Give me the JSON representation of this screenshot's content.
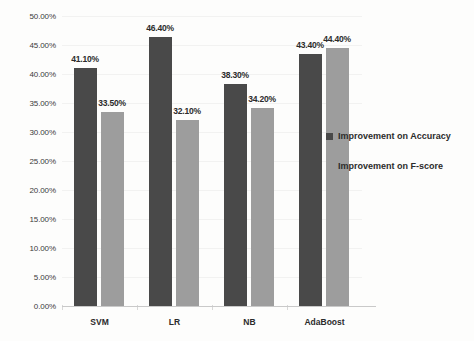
{
  "chart_data": {
    "type": "bar",
    "title": "",
    "subtitle": "",
    "xlabel": "",
    "ylabel": "",
    "categories": [
      "SVM",
      "LR",
      "NB",
      "AdaBoost"
    ],
    "series": [
      {
        "name": "Improvement on Accuracy",
        "color": "#494949",
        "values": [
          41.1,
          46.4,
          38.3,
          43.4
        ],
        "labels": [
          "41.10%",
          "46.40%",
          "38.30%",
          "43.40%"
        ]
      },
      {
        "name": "Improvement on F-score",
        "color": "#9d9d9d",
        "values": [
          33.5,
          32.1,
          34.2,
          44.4
        ],
        "labels": [
          "33.50%",
          "32.10%",
          "34.20%",
          "44.40%"
        ]
      }
    ],
    "ylim": [
      0,
      50
    ],
    "ytick_values": [
      0,
      5,
      10,
      15,
      20,
      25,
      30,
      35,
      40,
      45,
      50
    ],
    "ytick_labels": [
      "0.00%",
      "5.00%",
      "10.00%",
      "15.00%",
      "20.00%",
      "25.00%",
      "30.00%",
      "35.00%",
      "40.00%",
      "45.00%",
      "50.00%"
    ],
    "grid": true,
    "legend_position": "right"
  },
  "legend": {
    "entries": [
      {
        "label": "Improvement on Accuracy",
        "color": "#494949"
      },
      {
        "label": "Improvement on F-score",
        "color": "#9d9d9d"
      }
    ]
  }
}
